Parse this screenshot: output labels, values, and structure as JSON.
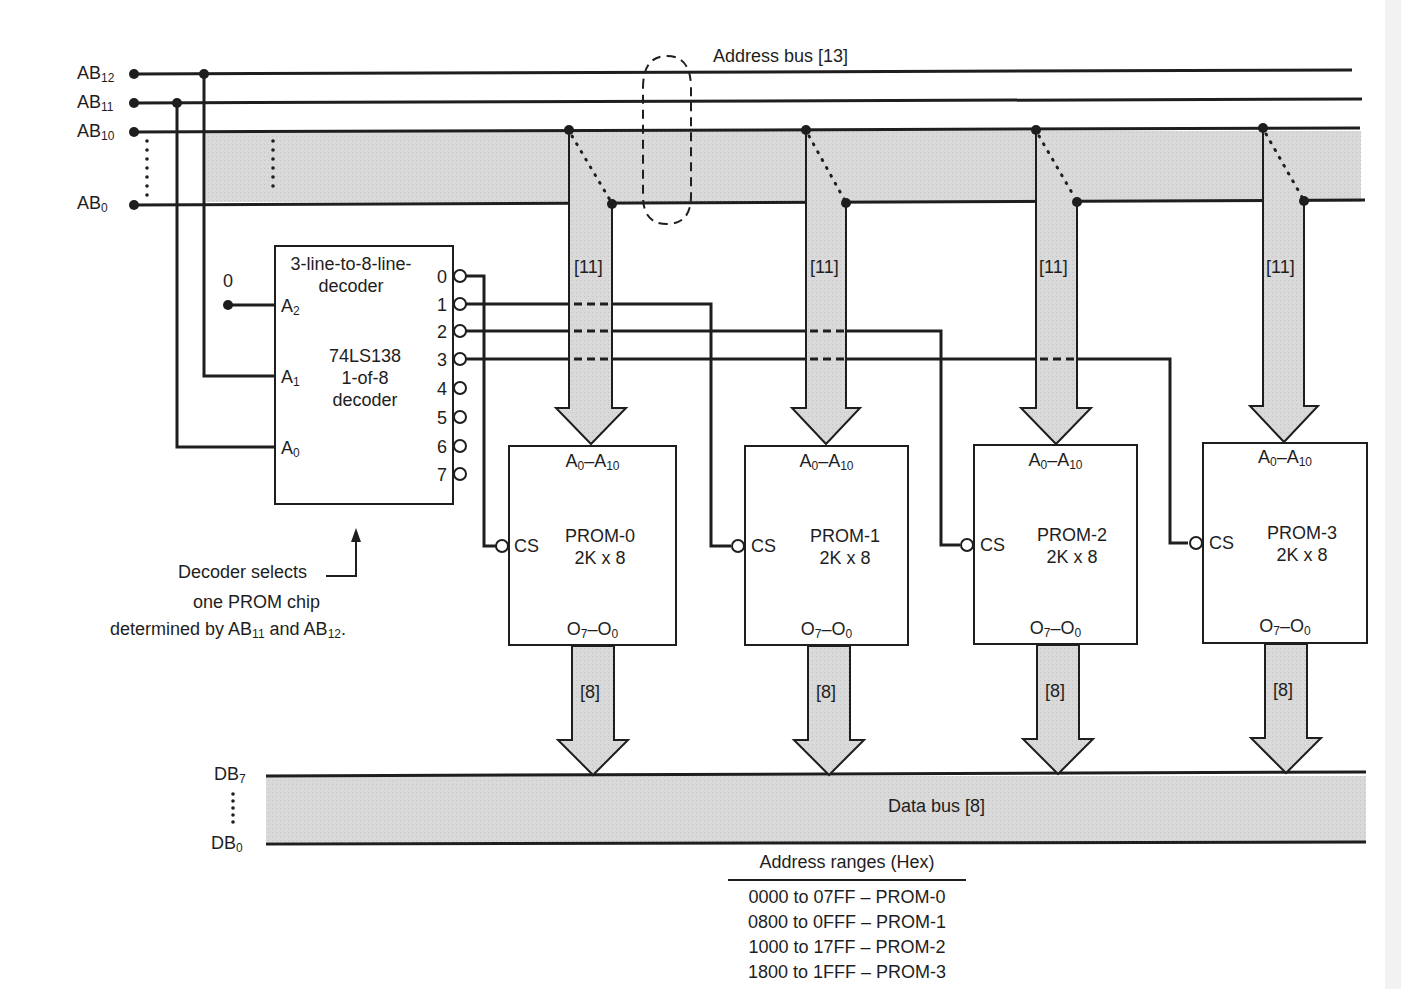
{
  "address_bus": {
    "label": "Address bus [13]",
    "lines": [
      {
        "name": "AB",
        "sub": "12"
      },
      {
        "name": "AB",
        "sub": "11"
      },
      {
        "name": "AB",
        "sub": "10"
      },
      {
        "name": "AB",
        "sub": "0"
      }
    ]
  },
  "decoder": {
    "title_line1": "3-line-to-8-line-",
    "title_line2": "decoder",
    "part_line1": "74LS138",
    "part_line2": "1-of-8",
    "part_line3": "decoder",
    "inputs": [
      {
        "name": "A",
        "sub": "2"
      },
      {
        "name": "A",
        "sub": "1"
      },
      {
        "name": "A",
        "sub": "0"
      }
    ],
    "a2_tie_value": "0",
    "outputs": [
      "0",
      "1",
      "2",
      "3",
      "4",
      "5",
      "6",
      "7"
    ]
  },
  "note": {
    "line1": "Decoder selects",
    "line2": "one PROM chip",
    "line3_prefix": "determined by AB",
    "line3_sub1": "11",
    "line3_mid": " and AB",
    "line3_sub2": "12",
    "line3_suffix": "."
  },
  "bus_width_addr": "[11]",
  "bus_width_data": "[8]",
  "proms": [
    {
      "name": "PROM-0",
      "size": "2K x 8",
      "cs": "CS",
      "addr_pins": "A0-A10",
      "data_pins": "O7-O0"
    },
    {
      "name": "PROM-1",
      "size": "2K x 8",
      "cs": "CS",
      "addr_pins": "A0-A10",
      "data_pins": "O7-O0"
    },
    {
      "name": "PROM-2",
      "size": "2K x 8",
      "cs": "CS",
      "addr_pins": "A0-A10",
      "data_pins": "O7-O0"
    },
    {
      "name": "PROM-3",
      "size": "2K x 8",
      "cs": "CS",
      "addr_pins": "A0-A10",
      "data_pins": "O7-O0"
    }
  ],
  "data_bus": {
    "label": "Data bus [8]",
    "top": {
      "name": "DB",
      "sub": "7"
    },
    "bottom": {
      "name": "DB",
      "sub": "0"
    }
  },
  "address_ranges": {
    "title": "Address ranges (Hex)",
    "rows": [
      "0000 to 07FF – PROM-0",
      "0800 to 0FFF – PROM-1",
      "1000 to 17FF – PROM-2",
      "1800 to 1FFF – PROM-3"
    ]
  },
  "colors": {
    "line": "#1e1e1e",
    "bus_fill": "#d6d6d6",
    "background": "#ffffff"
  }
}
